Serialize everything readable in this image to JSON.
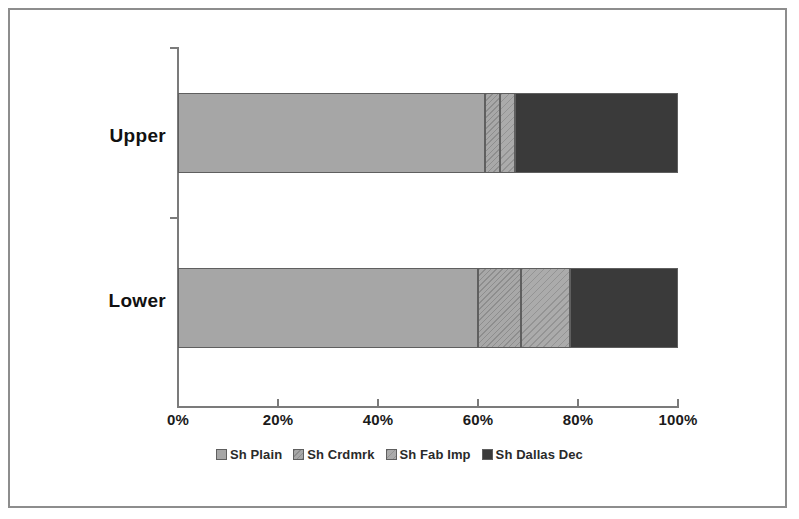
{
  "chart_data": {
    "type": "bar",
    "orientation": "horizontal",
    "stacked": true,
    "normalized": true,
    "title": "",
    "subtitle": "",
    "xlabel": "",
    "ylabel": "",
    "categories": [
      "Upper",
      "Lower"
    ],
    "xlim": [
      0,
      100
    ],
    "xticks": [
      0,
      20,
      40,
      60,
      80,
      100
    ],
    "xtick_labels": [
      "0%",
      "20%",
      "40%",
      "60%",
      "80%",
      "100%"
    ],
    "grid": false,
    "legend_position": "bottom",
    "series": [
      {
        "name": "Sh Plain",
        "fill": "solid-light-gray",
        "color": "#a6a6a6",
        "values": [
          61.4,
          60.0
        ]
      },
      {
        "name": "Sh Crdmrk",
        "fill": "diagonal-hatch-dense",
        "color": "#a8a8a8",
        "values": [
          3.0,
          8.6
        ]
      },
      {
        "name": "Sh Fab Imp",
        "fill": "diagonal-hatch-sparse",
        "color": "#ababab",
        "values": [
          3.0,
          9.8
        ]
      },
      {
        "name": "Sh Dallas Dec",
        "fill": "solid-dark",
        "color": "#3a3a3a",
        "values": [
          32.6,
          21.6
        ]
      }
    ],
    "stacks": [
      {
        "category": "Upper",
        "segments": [
          {
            "name": "Sh Plain",
            "start": 0.0,
            "end": 61.4,
            "value": 61.4
          },
          {
            "name": "Sh Crdmrk",
            "start": 61.4,
            "end": 64.4,
            "value": 3.0
          },
          {
            "name": "Sh Fab Imp",
            "start": 64.4,
            "end": 67.4,
            "value": 3.0
          },
          {
            "name": "Sh Dallas Dec",
            "start": 67.4,
            "end": 100.0,
            "value": 32.6
          }
        ]
      },
      {
        "category": "Lower",
        "segments": [
          {
            "name": "Sh Plain",
            "start": 0.0,
            "end": 60.0,
            "value": 60.0
          },
          {
            "name": "Sh Crdmrk",
            "start": 60.0,
            "end": 68.6,
            "value": 8.6
          },
          {
            "name": "Sh Fab Imp",
            "start": 68.6,
            "end": 78.4,
            "value": 9.8
          },
          {
            "name": "Sh Dallas Dec",
            "start": 78.4,
            "end": 100.0,
            "value": 21.6
          }
        ]
      }
    ]
  },
  "axis": {
    "ticks": [
      {
        "label": "0%",
        "value": 0
      },
      {
        "label": "20%",
        "value": 20
      },
      {
        "label": "40%",
        "value": 40
      },
      {
        "label": "60%",
        "value": 60
      },
      {
        "label": "80%",
        "value": 80
      },
      {
        "label": "100%",
        "value": 100
      }
    ]
  },
  "categories": {
    "upper": "Upper",
    "lower": "Lower"
  },
  "legend": {
    "items": [
      {
        "label": "Sh Plain"
      },
      {
        "label": "Sh Crdmrk"
      },
      {
        "label": "Sh Fab Imp"
      },
      {
        "label": "Sh Dallas Dec"
      }
    ]
  },
  "colors": {
    "plain": "#a6a6a6",
    "crdmrk": "#a8a8a8",
    "fab_imp": "#ababab",
    "dallas_dec": "#3a3a3a",
    "axis": "#7b7b7b",
    "frame": "#8d8d8d",
    "text": "#111111"
  }
}
